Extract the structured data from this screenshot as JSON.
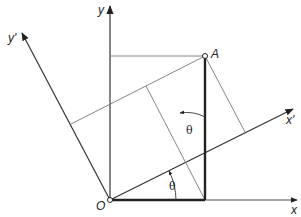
{
  "labels": {
    "x_axis": "x",
    "y_axis": "y",
    "x_prime_axis": "x'",
    "y_prime_axis": "y'",
    "origin": "O",
    "point": "A",
    "angle_lower": "θ",
    "angle_upper": "θ"
  },
  "colors": {
    "axis": "#333333",
    "thin_line": "#666666",
    "thick_line": "#222222"
  }
}
